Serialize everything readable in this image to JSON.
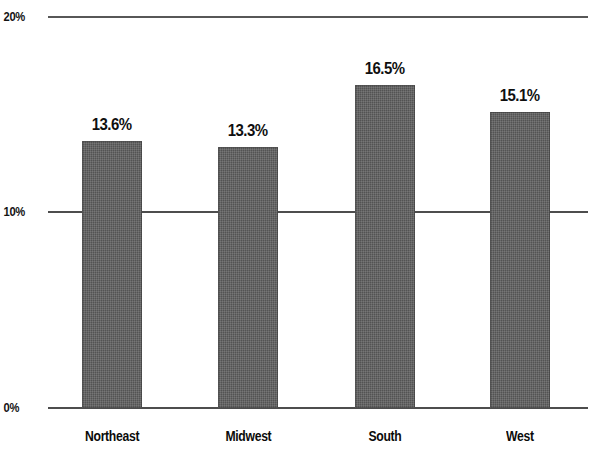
{
  "chart_data": {
    "type": "bar",
    "title": "",
    "subtitle": "",
    "xlabel": "",
    "ylabel": "",
    "categories": [
      "Northeast",
      "Midwest",
      "South",
      "West"
    ],
    "values": [
      13.6,
      13.3,
      16.5,
      15.1
    ],
    "value_labels": [
      "13.6%",
      "13.3%",
      "16.5%",
      "15.1%"
    ],
    "ylim": [
      0,
      20
    ],
    "yticks": [
      0,
      10,
      20
    ],
    "ytick_labels": [
      "0%",
      "10%",
      "20%"
    ],
    "grid": true,
    "grid_axis": "y",
    "legend": false,
    "legend_position": "none",
    "bar_color": "#575757",
    "bar_edge_color": "#3c3c3c",
    "background_color": "#ffffff",
    "text_color": "#0f0f0f",
    "gridline_color": "#4d4d4d",
    "series": [
      {
        "name": "Percent",
        "values": [
          13.6,
          13.3,
          16.5,
          15.1
        ]
      }
    ]
  },
  "axis": {
    "y": {
      "tick_20": "20%",
      "tick_10": "10%",
      "tick_0": "0%"
    }
  },
  "bars": [
    {
      "category": "Northeast",
      "value_label": "13.6%"
    },
    {
      "category": "Midwest",
      "value_label": "13.3%"
    },
    {
      "category": "South",
      "value_label": "16.5%"
    },
    {
      "category": "West",
      "value_label": "15.1%"
    }
  ]
}
